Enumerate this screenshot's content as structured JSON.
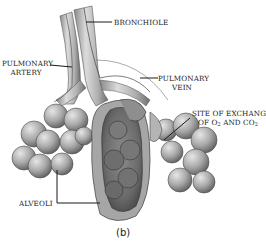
{
  "diagram": {
    "caption": "(b)",
    "labels": {
      "bronchiole": "BRONCHIOLE",
      "pulmonary_artery_line1": "PULMONARY",
      "pulmonary_artery_line2": "ARTERY",
      "pulmonary_vein_line1": "PULMONARY",
      "pulmonary_vein_line2": "VEIN",
      "exchange_line1": "SITE OF EXCHANGE",
      "exchange_line2_prefix": "OF O",
      "exchange_o2_sub": "2",
      "exchange_line2_mid": " AND CO",
      "exchange_co2_sub": "2",
      "alveoli": "ALVEOLI"
    },
    "colors": {
      "tissue_light": "#d9d9d9",
      "tissue_mid": "#9c9c9c",
      "tissue_dark": "#5a5a5a",
      "leader_line": "#1a1a1a"
    }
  }
}
